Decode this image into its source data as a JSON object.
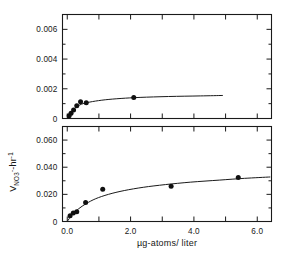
{
  "figure": {
    "background": "#ffffff",
    "ink_color": "#1a1a1a",
    "y_axis_title_parts": {
      "main": "V",
      "subscript": "NO",
      "subscript_number": "3",
      "subscript_charge": "-",
      "unit": "-hr",
      "unit_exponent": "-1"
    },
    "y_axis_title_plain": "V NO3- -hr-1",
    "x_axis_title": "µg-atoms/ liter"
  },
  "chart_data": [
    {
      "type": "scatter",
      "panel": "upper",
      "title": "",
      "xlabel": "",
      "ylabel": "",
      "xlim": [
        -0.15,
        6.45
      ],
      "ylim": [
        0,
        0.007
      ],
      "grid": false,
      "legend": null,
      "y_ticklabels": [
        "0",
        "0.002",
        "0.004",
        "0.006"
      ],
      "y_tickvalues": [
        0,
        0.002,
        0.004,
        0.006
      ],
      "y_minor_tickvalues": [
        0.001,
        0.003,
        0.005,
        0.007
      ],
      "x_tickvalues": [
        0.0,
        1.0,
        2.0,
        3.0,
        4.0,
        5.0,
        6.0
      ],
      "x_labeled_tickvalues": [
        0.0,
        2.0,
        4.0,
        6.0
      ],
      "points": [
        {
          "x": 0.06,
          "y": 0.00018
        },
        {
          "x": 0.12,
          "y": 0.00036
        },
        {
          "x": 0.2,
          "y": 0.00058
        },
        {
          "x": 0.3,
          "y": 0.00085
        },
        {
          "x": 0.42,
          "y": 0.00112
        },
        {
          "x": 0.6,
          "y": 0.00106
        },
        {
          "x": 2.1,
          "y": 0.00142
        }
      ],
      "curve": [
        {
          "x": 0.0,
          "y": 0.0
        },
        {
          "x": 0.1,
          "y": 0.00035
        },
        {
          "x": 0.2,
          "y": 0.0006
        },
        {
          "x": 0.32,
          "y": 0.00082
        },
        {
          "x": 0.5,
          "y": 0.001
        },
        {
          "x": 0.8,
          "y": 0.00114
        },
        {
          "x": 1.2,
          "y": 0.00126
        },
        {
          "x": 1.7,
          "y": 0.00135
        },
        {
          "x": 2.3,
          "y": 0.00142
        },
        {
          "x": 3.2,
          "y": 0.00148
        },
        {
          "x": 4.2,
          "y": 0.00152
        },
        {
          "x": 4.9,
          "y": 0.00155
        }
      ]
    },
    {
      "type": "scatter",
      "panel": "lower",
      "title": "",
      "xlabel": "µg-atoms/ liter",
      "ylabel": "V NO3- -hr-1",
      "xlim": [
        -0.15,
        6.45
      ],
      "ylim": [
        0,
        0.07
      ],
      "grid": false,
      "legend": null,
      "y_ticklabels": [
        "0",
        "0.020",
        "0.040",
        "0.060"
      ],
      "y_tickvalues": [
        0,
        0.02,
        0.04,
        0.06
      ],
      "y_minor_tickvalues": [
        0.01,
        0.03,
        0.05,
        0.07
      ],
      "x_tickvalues": [
        0.0,
        1.0,
        2.0,
        3.0,
        4.0,
        5.0,
        6.0
      ],
      "x_labeled_tickvalues": [
        0.0,
        2.0,
        4.0,
        6.0
      ],
      "x_ticklabels": [
        "0.0",
        "2.0",
        "4.0",
        "6.0"
      ],
      "points": [
        {
          "x": 0.09,
          "y": 0.0042
        },
        {
          "x": 0.19,
          "y": 0.0062
        },
        {
          "x": 0.3,
          "y": 0.0072
        },
        {
          "x": 0.58,
          "y": 0.014
        },
        {
          "x": 1.12,
          "y": 0.0238
        },
        {
          "x": 3.28,
          "y": 0.026
        },
        {
          "x": 5.4,
          "y": 0.0325
        }
      ],
      "curve": [
        {
          "x": 0.0,
          "y": 0.0
        },
        {
          "x": 0.15,
          "y": 0.0048
        },
        {
          "x": 0.35,
          "y": 0.0092
        },
        {
          "x": 0.6,
          "y": 0.0132
        },
        {
          "x": 0.9,
          "y": 0.0168
        },
        {
          "x": 1.3,
          "y": 0.02
        },
        {
          "x": 1.8,
          "y": 0.0228
        },
        {
          "x": 2.4,
          "y": 0.0252
        },
        {
          "x": 3.1,
          "y": 0.0272
        },
        {
          "x": 3.9,
          "y": 0.029
        },
        {
          "x": 4.8,
          "y": 0.0305
        },
        {
          "x": 5.6,
          "y": 0.0318
        },
        {
          "x": 6.4,
          "y": 0.0328
        }
      ]
    }
  ]
}
